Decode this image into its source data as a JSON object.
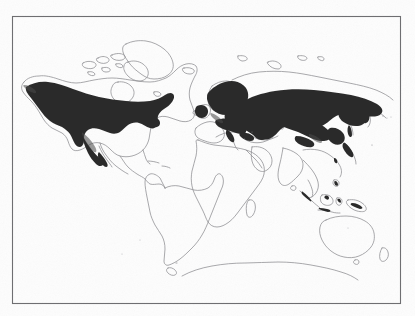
{
  "figure": {
    "type": "distribution-map",
    "projection": "equirectangular world map",
    "caption": "",
    "title": "",
    "legend": [],
    "annotations": [],
    "frame": {
      "x": 12,
      "y": 16,
      "width": 389,
      "height": 288,
      "stroke_color": "#6f6f72",
      "stroke_width": 1
    },
    "colors": {
      "background": "#fdfdfd",
      "coastline": "#8d8d92",
      "range_fill": "#2b2b2b",
      "range_fill_light": "#4a4a4a",
      "frame": "#6f6f72",
      "smudge": "#c9c9cc"
    },
    "shaded_range_regions": [
      "Alaska",
      "Western and central Canada",
      "Rocky Mountains of the western United States",
      "Great Lakes and northeastern United States",
      "Sierra Madre Occidental of Mexico",
      "Scandinavia and Fennoscandia",
      "Northern and central European Russia",
      "Siberia",
      "Mongolia and northeastern China",
      "Kamchatka and the Russian Far East",
      "Alps and Balkan mountains",
      "Caucasus and northern Turkey",
      "Himalaya and Tibetan margin",
      "Japan and Sakhalin",
      "Sumatra, Java and New Guinea highlands"
    ],
    "unshaded_regions": [
      "South America",
      "Africa",
      "Arabian Peninsula",
      "Indian subcontinent",
      "Australia",
      "New Zealand",
      "Greenland",
      "Antarctica"
    ],
    "landmass_labels": [
      "North America",
      "South America",
      "Greenland",
      "Europe",
      "Africa",
      "Asia",
      "Australia",
      "Antarctica"
    ]
  },
  "image_quality": {
    "appearance": "scanned black and white book plate",
    "artifacts": "faint grey smudges along the upper margin"
  }
}
